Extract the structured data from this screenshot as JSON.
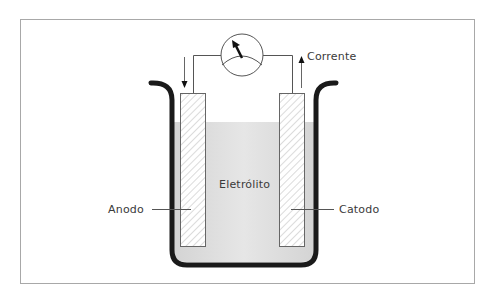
{
  "diagram": {
    "labels": {
      "current": "Corrente",
      "anode": "Anodo",
      "cathode": "Catodo",
      "electrolyte": "Eletrólito"
    },
    "components": [
      "ammeter",
      "anode",
      "cathode",
      "beaker",
      "electrolyte",
      "wire"
    ],
    "arrows": {
      "left": "down",
      "right": "up"
    },
    "colors": {
      "frame": "#a8a8a8",
      "beaker": "#1a1a1a",
      "electrolyte": "#d9d9d9",
      "line": "#555555",
      "hatch": "#b8b8b8"
    }
  }
}
